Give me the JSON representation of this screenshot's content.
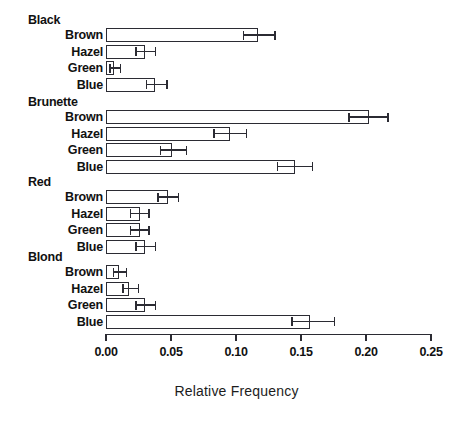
{
  "chart_data": {
    "type": "bar",
    "orientation": "horizontal",
    "title": "",
    "xlabel": "Relative Frequency",
    "ylabel": "",
    "xlim": [
      0.0,
      0.25
    ],
    "xticks": [
      0.0,
      0.05,
      0.1,
      0.15,
      0.2,
      0.25
    ],
    "xticklabels": [
      "0.00",
      "0.05",
      "0.10",
      "0.15",
      "0.20",
      "0.25"
    ],
    "grid": false,
    "legend": false,
    "error_bars": true,
    "groups": [
      {
        "label": "Black",
        "categories": [
          "Brown",
          "Hazel",
          "Green",
          "Blue"
        ],
        "values": [
          0.117,
          0.03,
          0.006,
          0.038
        ],
        "err_low": [
          0.106,
          0.023,
          0.003,
          0.031
        ],
        "err_high": [
          0.13,
          0.038,
          0.011,
          0.047
        ]
      },
      {
        "label": "Brunette",
        "categories": [
          "Brown",
          "Hazel",
          "Green",
          "Blue"
        ],
        "values": [
          0.202,
          0.095,
          0.051,
          0.145
        ],
        "err_low": [
          0.187,
          0.083,
          0.042,
          0.132
        ],
        "err_high": [
          0.217,
          0.108,
          0.062,
          0.159
        ]
      },
      {
        "label": "Red",
        "categories": [
          "Brown",
          "Hazel",
          "Green",
          "Blue"
        ],
        "values": [
          0.048,
          0.026,
          0.026,
          0.03
        ],
        "err_low": [
          0.04,
          0.019,
          0.019,
          0.023
        ],
        "err_high": [
          0.056,
          0.033,
          0.033,
          0.038
        ]
      },
      {
        "label": "Blond",
        "categories": [
          "Brown",
          "Hazel",
          "Green",
          "Blue"
        ],
        "values": [
          0.01,
          0.018,
          0.03,
          0.157
        ],
        "err_low": [
          0.006,
          0.013,
          0.023,
          0.143
        ],
        "err_high": [
          0.016,
          0.025,
          0.038,
          0.176
        ]
      }
    ]
  },
  "layout": {
    "x_zero_px": 106,
    "px_per_unit": 1300,
    "bar_height_px": 14,
    "row_pitch_px": 16.5,
    "group_header_offset_px": 15,
    "group_start_y_px": [
      28,
      110,
      190,
      265
    ],
    "group_gap_px": 66,
    "axis_y_px": 334,
    "tick_len_px": 7,
    "tick_label_y_px": 345,
    "axis_title_y_px": 383,
    "label_right_px": 103,
    "header_left_px": 28
  },
  "style": {
    "bar_stroke": "#2b2b33",
    "bar_fill": "#ffffff",
    "text_color": "#111111",
    "axis_color": "#2b2b33",
    "background": "#ffffff"
  }
}
